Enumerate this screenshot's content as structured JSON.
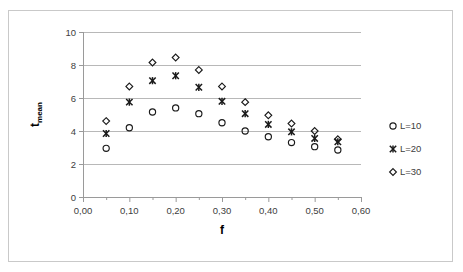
{
  "chart_data": {
    "type": "scatter",
    "title": "",
    "xlabel": "f",
    "ylabel": "t_mean",
    "ylabel_base": "t",
    "ylabel_sub": "mean",
    "xlim": [
      0.0,
      0.6
    ],
    "ylim": [
      0,
      10
    ],
    "grid": true,
    "legend_position": "right",
    "x_ticks": [
      "0,00",
      "0,10",
      "0,20",
      "0,30",
      "0,40",
      "0,50",
      "0,60"
    ],
    "x_tick_values": [
      0.0,
      0.1,
      0.2,
      0.3,
      0.4,
      0.5,
      0.6
    ],
    "x_minor_step": 0.05,
    "y_ticks": [
      "0",
      "2",
      "4",
      "6",
      "8",
      "10"
    ],
    "y_tick_values": [
      0,
      2,
      4,
      6,
      8,
      10
    ],
    "x": [
      0.05,
      0.1,
      0.15,
      0.2,
      0.25,
      0.3,
      0.35,
      0.4,
      0.45,
      0.5,
      0.55
    ],
    "series": [
      {
        "name": "L=10",
        "marker": "circle",
        "values": [
          2.95,
          4.2,
          5.15,
          5.4,
          5.05,
          4.5,
          4.0,
          3.65,
          3.3,
          3.05,
          2.85
        ]
      },
      {
        "name": "L=20",
        "marker": "x",
        "values": [
          3.85,
          5.75,
          7.05,
          7.35,
          6.65,
          5.8,
          5.05,
          4.4,
          3.95,
          3.55,
          3.35
        ]
      },
      {
        "name": "L=30",
        "marker": "diamond",
        "values": [
          4.6,
          6.7,
          8.15,
          8.45,
          7.7,
          6.7,
          5.75,
          4.95,
          4.45,
          4.0,
          3.5
        ]
      }
    ],
    "legend": [
      {
        "label": "L=10",
        "marker": "circle"
      },
      {
        "label": "L=20",
        "marker": "x"
      },
      {
        "label": "L=30",
        "marker": "diamond"
      }
    ],
    "colors": {
      "marker": "#1a1a1a",
      "grid": "#b8b8b8",
      "axis": "#9a9a9a",
      "tick_text": "#404040",
      "frame": "#c9c9c9",
      "background": "#ffffff"
    }
  }
}
